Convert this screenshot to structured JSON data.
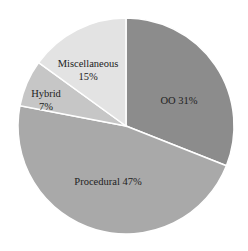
{
  "chart_data": {
    "type": "pie",
    "title": "",
    "categories": [
      "OO",
      "Procedural",
      "Hybrid",
      "Miscellaneous"
    ],
    "values": [
      31,
      47,
      7,
      15
    ],
    "labels": [
      "OO 31%",
      "Procedural 47%",
      "Hybrid",
      "Miscellaneous"
    ],
    "sublabels": [
      "",
      "",
      "7%",
      "15%"
    ],
    "colors": [
      "#8c8c8c",
      "#a9a9a9",
      "#c6c6c6",
      "#e3e3e3"
    ],
    "start_angle_deg": 0,
    "direction": "clockwise",
    "legend": "none"
  }
}
